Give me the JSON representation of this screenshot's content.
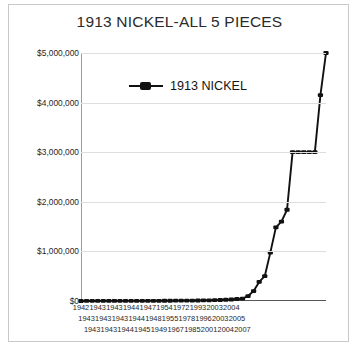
{
  "chart_data": {
    "type": "line",
    "title": "1913 NICKEL-ALL 5 PIECES",
    "xlabel": "",
    "ylabel": "",
    "ylim": [
      0,
      5000000
    ],
    "yticks": [
      0,
      1000000,
      2000000,
      3000000,
      4000000,
      5000000
    ],
    "ytick_labels": [
      "$0",
      "$1,000,000",
      "$2,000,000",
      "$3,000,000",
      "$4,000,000",
      "$5,000,000"
    ],
    "grid": true,
    "legend_position": "upper-left-inside",
    "legend": [
      "1913 NICKEL"
    ],
    "series": [
      {
        "name": "1913 NICKEL",
        "values": [
          500,
          900,
          1200,
          1500,
          1800,
          2000,
          2200,
          2500,
          2800,
          3000,
          3200,
          3500,
          3800,
          4000,
          4500,
          5000,
          5500,
          6000,
          7000,
          8000,
          9000,
          10000,
          12000,
          14000,
          16000,
          20000,
          25000,
          30000,
          40000,
          46000,
          100000,
          200000,
          385000,
          500000,
          975000,
          1485000,
          1600000,
          1840000,
          3000000,
          3000000,
          3000000,
          3000000,
          3000000,
          4150000,
          5000000
        ]
      }
    ],
    "x_tick_rows": [
      [
        "1942",
        "1943",
        "1943",
        "1944",
        "1947",
        "1954",
        "1972",
        "1993",
        "2003",
        "2004"
      ],
      [
        "1943",
        "1943",
        "1943",
        "1944",
        "1948",
        "1955",
        "1978",
        "1996",
        "2003",
        "2005"
      ],
      [
        "1943",
        "1943",
        "1944",
        "1945",
        "1949",
        "1967",
        "1985",
        "2001",
        "2004",
        "2007"
      ]
    ],
    "x_tick_labels_flat": [
      "1942",
      "1943",
      "1943",
      "1943",
      "1943",
      "1943",
      "1943",
      "1944",
      "1944",
      "1944",
      "1945",
      "1947",
      "1948",
      "1949",
      "1954",
      "1955",
      "1967",
      "1972",
      "1978",
      "1985",
      "1993",
      "1996",
      "2001",
      "2003",
      "2003",
      "2004",
      "2004",
      "2005",
      "2007"
    ],
    "colors": {
      "series": "#111111",
      "grid": "#dddddd",
      "axis": "#555555",
      "text": "#1f1f1f",
      "background": "#ffffff",
      "frame": "#c9c9c9"
    }
  }
}
